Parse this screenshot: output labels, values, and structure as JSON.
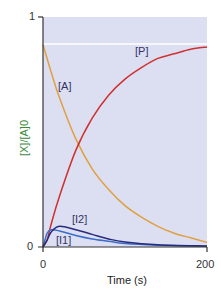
{
  "chart_data": {
    "type": "line",
    "title": "",
    "xlabel": "Time (s)",
    "ylabel": "[X]/[A]0",
    "xlim": [
      0,
      200
    ],
    "ylim": [
      0,
      1
    ],
    "x_ticks": [
      "0",
      "200"
    ],
    "y_ticks": [
      "0",
      "1"
    ],
    "grid": false,
    "legend": "inline labels",
    "reference_line": {
      "y": 0.88,
      "color": "#ffffff"
    },
    "series": [
      {
        "name": "[A]",
        "color": "#e0a040",
        "x": [
          0,
          10,
          20,
          40,
          60,
          80,
          100,
          120,
          140,
          160,
          180,
          200
        ],
        "values": [
          0.88,
          0.76,
          0.65,
          0.47,
          0.34,
          0.25,
          0.18,
          0.13,
          0.09,
          0.06,
          0.04,
          0.02
        ]
      },
      {
        "name": "[P]",
        "color": "#d03030",
        "x": [
          0,
          5,
          10,
          20,
          40,
          60,
          80,
          100,
          120,
          140,
          160,
          180,
          200
        ],
        "values": [
          0.0,
          0.03,
          0.1,
          0.22,
          0.42,
          0.56,
          0.66,
          0.73,
          0.78,
          0.82,
          0.84,
          0.86,
          0.87
        ]
      },
      {
        "name": "[I1]",
        "color": "#3a6ec8",
        "x": [
          0,
          5,
          10,
          20,
          40,
          60,
          80,
          100,
          140,
          200
        ],
        "values": [
          0.0,
          0.06,
          0.075,
          0.07,
          0.05,
          0.035,
          0.025,
          0.015,
          0.008,
          0.003
        ]
      },
      {
        "name": "[I2]",
        "color": "#2a2a7a",
        "x": [
          0,
          5,
          10,
          20,
          40,
          60,
          80,
          100,
          140,
          200
        ],
        "values": [
          0.0,
          0.03,
          0.065,
          0.09,
          0.075,
          0.055,
          0.035,
          0.022,
          0.01,
          0.004
        ]
      }
    ],
    "annotations": [
      "[A]",
      "[P]",
      "[I1]",
      "[I2]"
    ]
  },
  "labels": {
    "y_top": "1",
    "y_zero": "0",
    "x_zero": "0",
    "x_end": "200",
    "xlabel": "Time (s)",
    "ylabel": "[X]/[A]0",
    "A": "[A]",
    "P": "[P]",
    "I1": "[I1]",
    "I2": "[I2]"
  },
  "colors": {
    "plot_bg": "#dcdff2",
    "axis": "#333333",
    "ylabel": "#3b8a3b"
  }
}
